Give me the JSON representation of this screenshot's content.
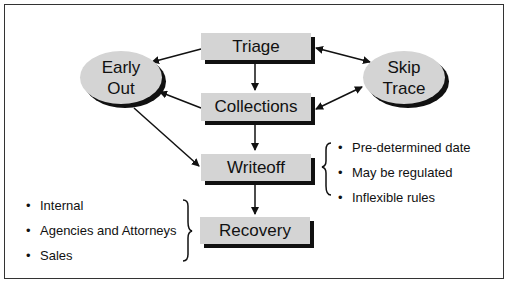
{
  "diagram": {
    "nodes": {
      "triage": "Triage",
      "collections": "Collections",
      "writeoff": "Writeoff",
      "recovery": "Recovery",
      "early_out_line1": "Early",
      "early_out_line2": "Out",
      "skip_trace_line1": "Skip",
      "skip_trace_line2": "Trace"
    },
    "writeoff_notes": [
      "Pre-determined date",
      "May be regulated",
      "Inflexible rules"
    ],
    "recovery_notes": [
      "Internal",
      "Agencies and Attorneys",
      "Sales"
    ],
    "edges": [
      {
        "from": "Triage",
        "to": "Early Out"
      },
      {
        "from": "Triage",
        "to": "Collections"
      },
      {
        "from": "Triage",
        "to": "Skip Trace",
        "bidirectional": true
      },
      {
        "from": "Collections",
        "to": "Early Out"
      },
      {
        "from": "Collections",
        "to": "Skip Trace",
        "bidirectional": true
      },
      {
        "from": "Collections",
        "to": "Writeoff"
      },
      {
        "from": "Early Out",
        "to": "Writeoff"
      },
      {
        "from": "Writeoff",
        "to": "Recovery"
      }
    ]
  }
}
